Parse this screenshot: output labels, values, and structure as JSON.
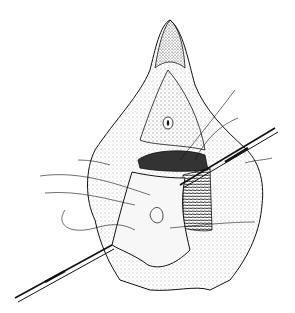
{
  "figure": {
    "colors": {
      "background": "#ffffff",
      "ink": "#111111",
      "dark_fill": "#333333",
      "stipple": "#555555"
    }
  }
}
